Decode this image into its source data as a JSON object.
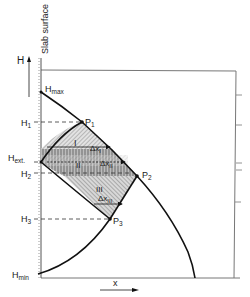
{
  "diagram": {
    "axis_title_vertical": "Slab surface",
    "y_axis_label": "H",
    "x_axis_label": "x",
    "levels": {
      "hmax": {
        "base": "H",
        "sub": "max"
      },
      "h1": {
        "base": "H",
        "sub": "1"
      },
      "hext": {
        "base": "H",
        "sub": "ext."
      },
      "h2": {
        "base": "H",
        "sub": "2"
      },
      "h3": {
        "base": "H",
        "sub": "3"
      },
      "hmin": {
        "base": "H",
        "sub": "min"
      }
    },
    "points": {
      "p1": {
        "base": "P",
        "sub": "1"
      },
      "p2": {
        "base": "P",
        "sub": "2"
      },
      "p3": {
        "base": "P",
        "sub": "3"
      }
    },
    "regions": {
      "r1": {
        "label": "I",
        "delta": "Δx",
        "delta_sub": "I"
      },
      "r2": {
        "label": "II",
        "delta": "Δx",
        "delta_sub": "II"
      },
      "r3": {
        "label": "III",
        "delta": "Δx",
        "delta_sub": "III"
      }
    },
    "colors": {
      "line": "#111111",
      "frame": "#777777",
      "hatch": "#9a9a9a"
    }
  }
}
